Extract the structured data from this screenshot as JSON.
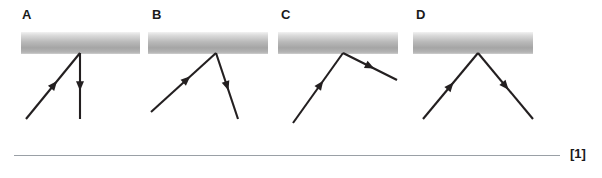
{
  "question": {
    "marks_label": "[1]",
    "rule_visible": true
  },
  "diagrams": [
    {
      "label": "A",
      "label_x": 22,
      "mirror": {
        "x": 21,
        "y": 32,
        "width": 119
      },
      "incident_ray": {
        "from": [
          26,
          119
        ],
        "to": [
          80,
          53
        ],
        "arrow_direction": "up-right",
        "arrow_at": 0.52
      },
      "reflected_ray": {
        "from": [
          80,
          53
        ],
        "to": [
          80,
          119
        ],
        "arrow_direction": "down",
        "arrow_at": 0.5
      },
      "description": "Incident ray from lower left to mirror; reflected ray drawn vertically downward along the normal"
    },
    {
      "label": "B",
      "label_x": 152,
      "mirror": {
        "x": 148,
        "y": 32,
        "width": 120
      },
      "incident_ray": {
        "from": [
          151,
          112
        ],
        "to": [
          216,
          53
        ],
        "arrow_direction": "up-right",
        "arrow_at": 0.55
      },
      "reflected_ray": {
        "from": [
          216,
          53
        ],
        "to": [
          238,
          119
        ],
        "arrow_direction": "down-right",
        "arrow_at": 0.5
      },
      "description": "Shallow incident ray from lower left; steep reflected ray down to the right, angles unequal"
    },
    {
      "label": "C",
      "label_x": 281,
      "mirror": {
        "x": 278,
        "y": 32,
        "width": 120
      },
      "incident_ray": {
        "from": [
          293,
          123
        ],
        "to": [
          343,
          53
        ],
        "arrow_direction": "up-right",
        "arrow_at": 0.55
      },
      "reflected_ray": {
        "from": [
          343,
          53
        ],
        "to": [
          397,
          80
        ],
        "arrow_direction": "down-right",
        "arrow_at": 0.5
      },
      "description": "Steep incident ray from lower left; shallow reflected ray down to the right, angles unequal"
    },
    {
      "label": "D",
      "label_x": 416,
      "mirror": {
        "x": 413,
        "y": 32,
        "width": 120
      },
      "incident_ray": {
        "from": [
          423,
          119
        ],
        "to": [
          478,
          53
        ],
        "arrow_direction": "up-right",
        "arrow_at": 0.5
      },
      "reflected_ray": {
        "from": [
          478,
          53
        ],
        "to": [
          533,
          119
        ],
        "arrow_direction": "down-right",
        "arrow_at": 0.5
      },
      "description": "Symmetric V: angle of incidence equals angle of reflection"
    }
  ],
  "colors": {
    "ray": "#231f20",
    "mirror_light": "#f2f2f2",
    "mirror_dark": "#a5a5a5",
    "rule": "#9aa0a6",
    "text": "#1a1a1a"
  }
}
